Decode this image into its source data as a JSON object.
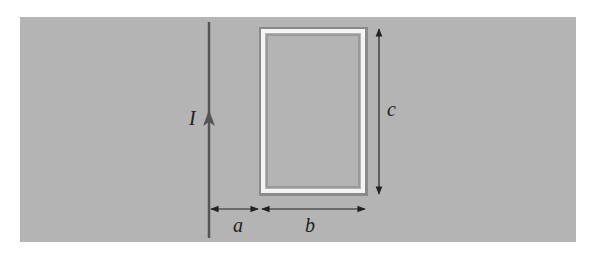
{
  "diagram": {
    "colors": {
      "panel": "#b4b4b4",
      "wire": "#555555",
      "loop_light": "#f2f2f2",
      "loop_dark": "#8a8a8a",
      "dimension": "#222222"
    },
    "labels": {
      "current": "I",
      "distance": "a",
      "width": "b",
      "height": "c"
    }
  }
}
